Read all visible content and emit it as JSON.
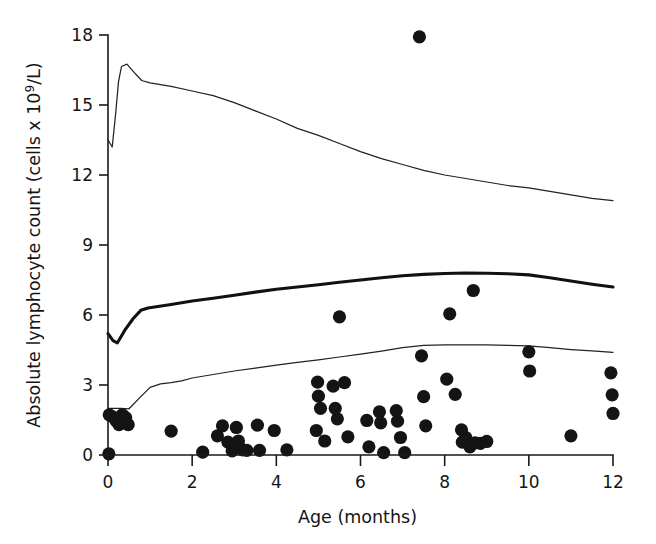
{
  "chart_data": {
    "type": "scatter",
    "title": "",
    "xlabel": "Age (months)",
    "ylabel": "Absolute lymphocyte count (cells x 10⁹/L)",
    "ylabel_main": "Absolute lymphocyte count (cells x 10",
    "ylabel_sup": "9",
    "ylabel_tail": "/L)",
    "xlim": [
      0,
      12
    ],
    "ylim": [
      0,
      18
    ],
    "xticks": [
      0,
      2,
      4,
      6,
      8,
      10,
      12
    ],
    "yticks": [
      0,
      3,
      6,
      9,
      12,
      15,
      18
    ],
    "xtick_labels": [
      "0",
      "2",
      "4",
      "6",
      "8",
      "10",
      "12"
    ],
    "ytick_labels": [
      "0",
      "3",
      "6",
      "9",
      "12",
      "15",
      "18"
    ],
    "grid": false,
    "legend": "none",
    "series": [
      {
        "name": "Upper reference percentile",
        "type": "line",
        "style": "thin",
        "points": [
          [
            0.0,
            13.5
          ],
          [
            0.1,
            13.2
          ],
          [
            0.18,
            14.6
          ],
          [
            0.25,
            16.0
          ],
          [
            0.32,
            16.65
          ],
          [
            0.45,
            16.75
          ],
          [
            0.62,
            16.4
          ],
          [
            0.8,
            16.05
          ],
          [
            1.0,
            15.95
          ],
          [
            1.5,
            15.8
          ],
          [
            2.0,
            15.6
          ],
          [
            2.5,
            15.4
          ],
          [
            3.0,
            15.1
          ],
          [
            3.5,
            14.75
          ],
          [
            4.0,
            14.4
          ],
          [
            4.5,
            14.0
          ],
          [
            5.0,
            13.7
          ],
          [
            5.5,
            13.35
          ],
          [
            6.0,
            13.0
          ],
          [
            6.5,
            12.7
          ],
          [
            7.0,
            12.45
          ],
          [
            7.5,
            12.2
          ],
          [
            8.0,
            12.0
          ],
          [
            8.5,
            11.85
          ],
          [
            9.0,
            11.7
          ],
          [
            9.5,
            11.55
          ],
          [
            10.0,
            11.45
          ],
          [
            10.5,
            11.3
          ],
          [
            11.0,
            11.15
          ],
          [
            11.5,
            11.0
          ],
          [
            12.0,
            10.9
          ]
        ]
      },
      {
        "name": "Median reference curve",
        "type": "line",
        "style": "bold",
        "points": [
          [
            0.0,
            5.2
          ],
          [
            0.12,
            4.9
          ],
          [
            0.22,
            4.8
          ],
          [
            0.4,
            5.35
          ],
          [
            0.6,
            5.85
          ],
          [
            0.78,
            6.2
          ],
          [
            0.95,
            6.3
          ],
          [
            1.5,
            6.45
          ],
          [
            2.0,
            6.6
          ],
          [
            2.5,
            6.72
          ],
          [
            3.0,
            6.85
          ],
          [
            3.5,
            6.98
          ],
          [
            4.0,
            7.1
          ],
          [
            4.5,
            7.2
          ],
          [
            5.0,
            7.3
          ],
          [
            5.5,
            7.4
          ],
          [
            6.0,
            7.5
          ],
          [
            6.5,
            7.6
          ],
          [
            7.0,
            7.68
          ],
          [
            7.5,
            7.74
          ],
          [
            8.0,
            7.78
          ],
          [
            8.5,
            7.8
          ],
          [
            9.0,
            7.79
          ],
          [
            9.5,
            7.77
          ],
          [
            10.0,
            7.72
          ],
          [
            10.5,
            7.6
          ],
          [
            11.0,
            7.46
          ],
          [
            11.5,
            7.32
          ],
          [
            12.0,
            7.2
          ]
        ]
      },
      {
        "name": "Lower reference percentile",
        "type": "line",
        "style": "thin",
        "points": [
          [
            0.0,
            2.0
          ],
          [
            0.3,
            2.0
          ],
          [
            0.5,
            1.98
          ],
          [
            0.75,
            2.45
          ],
          [
            1.0,
            2.9
          ],
          [
            1.25,
            3.05
          ],
          [
            1.5,
            3.1
          ],
          [
            1.75,
            3.18
          ],
          [
            2.0,
            3.3
          ],
          [
            2.5,
            3.45
          ],
          [
            3.0,
            3.6
          ],
          [
            3.5,
            3.72
          ],
          [
            4.0,
            3.85
          ],
          [
            4.5,
            3.97
          ],
          [
            5.0,
            4.08
          ],
          [
            5.5,
            4.2
          ],
          [
            6.0,
            4.32
          ],
          [
            6.5,
            4.45
          ],
          [
            7.0,
            4.6
          ],
          [
            7.5,
            4.7
          ],
          [
            8.0,
            4.72
          ],
          [
            8.5,
            4.72
          ],
          [
            9.0,
            4.72
          ],
          [
            9.5,
            4.7
          ],
          [
            10.0,
            4.68
          ],
          [
            10.5,
            4.6
          ],
          [
            11.0,
            4.52
          ],
          [
            11.5,
            4.46
          ],
          [
            12.0,
            4.4
          ]
        ]
      },
      {
        "name": "Patient observations",
        "type": "scatter",
        "points": [
          [
            0.02,
            0.05
          ],
          [
            0.03,
            1.72
          ],
          [
            0.12,
            1.62
          ],
          [
            0.2,
            1.45
          ],
          [
            0.26,
            1.3
          ],
          [
            0.34,
            1.72
          ],
          [
            0.42,
            1.6
          ],
          [
            0.48,
            1.3
          ],
          [
            1.5,
            1.02
          ],
          [
            2.25,
            0.12
          ],
          [
            2.6,
            0.82
          ],
          [
            2.72,
            1.25
          ],
          [
            2.85,
            0.55
          ],
          [
            2.95,
            0.18
          ],
          [
            3.05,
            1.18
          ],
          [
            3.1,
            0.6
          ],
          [
            3.2,
            0.22
          ],
          [
            3.3,
            0.2
          ],
          [
            3.55,
            1.28
          ],
          [
            3.6,
            0.2
          ],
          [
            3.95,
            1.05
          ],
          [
            4.25,
            0.22
          ],
          [
            4.95,
            1.05
          ],
          [
            4.98,
            3.12
          ],
          [
            5.0,
            2.52
          ],
          [
            5.05,
            2.0
          ],
          [
            5.15,
            0.6
          ],
          [
            5.35,
            2.95
          ],
          [
            5.4,
            2.0
          ],
          [
            5.45,
            1.55
          ],
          [
            5.5,
            5.92
          ],
          [
            5.62,
            3.1
          ],
          [
            5.7,
            0.78
          ],
          [
            6.15,
            1.48
          ],
          [
            6.2,
            0.35
          ],
          [
            6.45,
            1.85
          ],
          [
            6.48,
            1.38
          ],
          [
            6.55,
            0.1
          ],
          [
            6.85,
            1.9
          ],
          [
            6.88,
            1.45
          ],
          [
            6.95,
            0.75
          ],
          [
            7.05,
            0.1
          ],
          [
            7.4,
            17.92
          ],
          [
            7.45,
            4.25
          ],
          [
            7.5,
            2.5
          ],
          [
            7.55,
            1.25
          ],
          [
            8.05,
            3.25
          ],
          [
            8.12,
            6.05
          ],
          [
            8.25,
            2.6
          ],
          [
            8.4,
            1.08
          ],
          [
            8.42,
            0.55
          ],
          [
            8.5,
            0.75
          ],
          [
            8.6,
            0.35
          ],
          [
            8.68,
            7.05
          ],
          [
            8.72,
            0.52
          ],
          [
            8.85,
            0.5
          ],
          [
            9.0,
            0.58
          ],
          [
            10.0,
            4.42
          ],
          [
            10.02,
            3.6
          ],
          [
            11.0,
            0.82
          ],
          [
            11.95,
            3.52
          ],
          [
            11.98,
            2.58
          ],
          [
            12.0,
            1.78
          ]
        ]
      }
    ]
  }
}
